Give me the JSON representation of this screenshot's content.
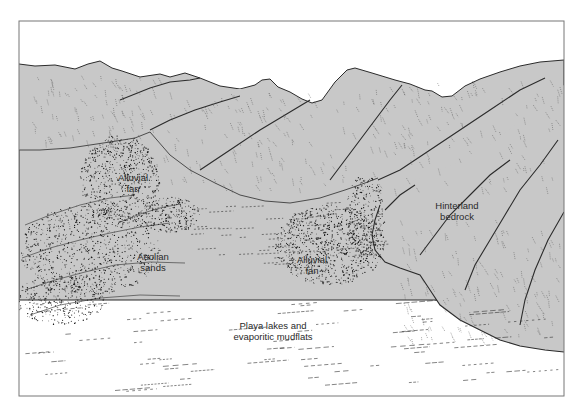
{
  "figure": {
    "colors": {
      "bedrock_fill": "#c8c8c8",
      "outline": "#2b2b2b",
      "hatching": "#555555",
      "stipple": "#1a1a1a",
      "basin_fill": "#ffffff",
      "frame": "#777777"
    }
  },
  "labels": {
    "alluvial_fan_left": [
      "Alluvial",
      "fan"
    ],
    "alluvial_fan_center": [
      "Alluvial",
      "fan"
    ],
    "hinterland_bedrock": [
      "Hinterland",
      "bedrock"
    ],
    "aeolian_sands": [
      "Aeolian",
      "sands"
    ],
    "playa_lakes": [
      "Playa lakes and",
      "evaporitic mudflats"
    ]
  }
}
